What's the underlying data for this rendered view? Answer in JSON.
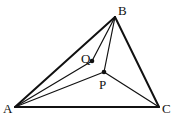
{
  "diagram": {
    "type": "geometry",
    "points": {
      "A": {
        "label": "A",
        "x": 15,
        "y": 107
      },
      "B": {
        "label": "B",
        "x": 115,
        "y": 17
      },
      "C": {
        "label": "C",
        "x": 159,
        "y": 107
      },
      "P": {
        "label": "P",
        "x": 104,
        "y": 72
      },
      "Q": {
        "label": "Q",
        "x": 92,
        "y": 61
      }
    },
    "segments": [
      {
        "from": "A",
        "to": "B",
        "style": "thick"
      },
      {
        "from": "B",
        "to": "C",
        "style": "thick"
      },
      {
        "from": "A",
        "to": "C",
        "style": "thick"
      },
      {
        "from": "A",
        "to": "Q",
        "style": "thin"
      },
      {
        "from": "B",
        "to": "Q",
        "style": "thin"
      },
      {
        "from": "A",
        "to": "P",
        "style": "thin"
      },
      {
        "from": "B",
        "to": "P",
        "style": "thin"
      },
      {
        "from": "C",
        "to": "P",
        "style": "thin"
      }
    ],
    "labels": {
      "A": "A",
      "B": "B",
      "C": "C",
      "P": "P",
      "Q": "Q"
    }
  }
}
